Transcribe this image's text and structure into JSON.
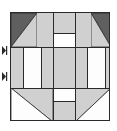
{
  "figure": {
    "kind": "quilt-block-diagram",
    "background_color": "#ffffff",
    "outline_color": "#2a2a2a"
  },
  "palette": {
    "dark": "#5f5f5f",
    "light": "#d0d0d0",
    "white": "#fdfdfd",
    "seam": "#2a2a2a"
  },
  "block": {
    "x": 10,
    "y": 12,
    "width": 100,
    "height": 109,
    "grid_columns": 5,
    "grid_rows": 5,
    "column_fractions": [
      0.26,
      0.16,
      0.22,
      0.16,
      0.2
    ],
    "row_fractions": [
      0.2,
      0.14,
      0.3,
      0.14,
      0.22
    ]
  },
  "patches": [
    {
      "name": "top-left-corner-triangle-dark",
      "shape": "triangle",
      "corner": "top-left",
      "fill": "dark",
      "x": 0,
      "y": 0,
      "w": 26,
      "h": 34
    },
    {
      "name": "top-left-corner-triangle-light",
      "shape": "triangle",
      "corner": "bottom-right",
      "fill": "light",
      "x": 0,
      "y": 0,
      "w": 26,
      "h": 34
    },
    {
      "name": "top-center-left-strip-light",
      "shape": "rect",
      "fill": "light",
      "x": 26,
      "y": 0,
      "w": 16,
      "h": 34
    },
    {
      "name": "top-center-bar-light",
      "shape": "rect",
      "fill": "light",
      "x": 42,
      "y": 0,
      "w": 22,
      "h": 20
    },
    {
      "name": "top-center-bar-white",
      "shape": "rect",
      "fill": "white",
      "x": 42,
      "y": 20,
      "w": 22,
      "h": 14
    },
    {
      "name": "top-right-strip-light",
      "shape": "rect",
      "fill": "light",
      "x": 64,
      "y": 0,
      "w": 16,
      "h": 34
    },
    {
      "name": "top-right-corner-triangle-dark",
      "shape": "triangle",
      "corner": "top-right",
      "fill": "dark",
      "x": 80,
      "y": 0,
      "w": 20,
      "h": 34
    },
    {
      "name": "top-right-corner-triangle-light",
      "shape": "triangle",
      "corner": "bottom-left",
      "fill": "light",
      "x": 80,
      "y": 0,
      "w": 20,
      "h": 34
    },
    {
      "name": "middle-left-strip-light",
      "shape": "rect",
      "fill": "light",
      "x": 0,
      "y": 34,
      "w": 12,
      "h": 41
    },
    {
      "name": "middle-left-white-rect",
      "shape": "rect",
      "fill": "white",
      "x": 12,
      "y": 34,
      "w": 18,
      "h": 41
    },
    {
      "name": "middle-left-inner-light",
      "shape": "rect",
      "fill": "light",
      "x": 30,
      "y": 34,
      "w": 12,
      "h": 41
    },
    {
      "name": "center-square-light",
      "shape": "rect",
      "fill": "light",
      "x": 42,
      "y": 34,
      "w": 22,
      "h": 41
    },
    {
      "name": "middle-right-inner-light",
      "shape": "rect",
      "fill": "light",
      "x": 64,
      "y": 34,
      "w": 12,
      "h": 41
    },
    {
      "name": "middle-right-white-rect",
      "shape": "rect",
      "fill": "white",
      "x": 76,
      "y": 34,
      "w": 18,
      "h": 41
    },
    {
      "name": "middle-right-strip-light",
      "shape": "rect",
      "fill": "light",
      "x": 94,
      "y": 34,
      "w": 6,
      "h": 41
    },
    {
      "name": "bottom-left-corner-triangle-light",
      "shape": "triangle",
      "corner": "top-right",
      "fill": "light",
      "x": 0,
      "y": 75,
      "w": 42,
      "h": 34
    },
    {
      "name": "bottom-left-corner-triangle-white",
      "shape": "triangle",
      "corner": "bottom-left",
      "fill": "white",
      "x": 0,
      "y": 75,
      "w": 42,
      "h": 34
    },
    {
      "name": "bottom-center-bar-white",
      "shape": "rect",
      "fill": "white",
      "x": 42,
      "y": 75,
      "w": 22,
      "h": 13
    },
    {
      "name": "bottom-center-bar-light",
      "shape": "rect",
      "fill": "light",
      "x": 42,
      "y": 88,
      "w": 22,
      "h": 21
    },
    {
      "name": "bottom-right-corner-triangle-light",
      "shape": "triangle",
      "corner": "top-left",
      "fill": "light",
      "x": 64,
      "y": 75,
      "w": 36,
      "h": 34
    },
    {
      "name": "bottom-right-corner-triangle-white",
      "shape": "triangle",
      "corner": "bottom-right",
      "fill": "white",
      "x": 64,
      "y": 75,
      "w": 36,
      "h": 34
    }
  ],
  "seams": [
    {
      "name": "seam-row-1",
      "orientation": "h",
      "x": 0,
      "y": 34,
      "length": 100
    },
    {
      "name": "seam-row-2",
      "orientation": "h",
      "x": 0,
      "y": 75,
      "length": 100
    },
    {
      "name": "seam-top-center-split",
      "orientation": "h",
      "x": 42,
      "y": 20,
      "length": 22
    },
    {
      "name": "seam-bottom-center-split",
      "orientation": "h",
      "x": 42,
      "y": 88,
      "length": 22
    },
    {
      "name": "seam-col-left-outer",
      "orientation": "v",
      "x": 12,
      "y": 34,
      "length": 41
    },
    {
      "name": "seam-col-left-inner",
      "orientation": "v",
      "x": 30,
      "y": 34,
      "length": 41
    },
    {
      "name": "seam-col-center-left",
      "orientation": "v",
      "x": 42,
      "y": 0,
      "length": 109
    },
    {
      "name": "seam-col-center-right",
      "orientation": "v",
      "x": 64,
      "y": 0,
      "length": 109
    },
    {
      "name": "seam-col-right-inner",
      "orientation": "v",
      "x": 76,
      "y": 34,
      "length": 41
    },
    {
      "name": "seam-col-right-outer",
      "orientation": "v",
      "x": 94,
      "y": 34,
      "length": 41
    }
  ],
  "measure_marks": [
    {
      "name": "measure-tick-upper",
      "x": 1,
      "y": 46,
      "label": ""
    },
    {
      "name": "measure-tick-lower",
      "x": 1,
      "y": 72,
      "label": ""
    }
  ]
}
